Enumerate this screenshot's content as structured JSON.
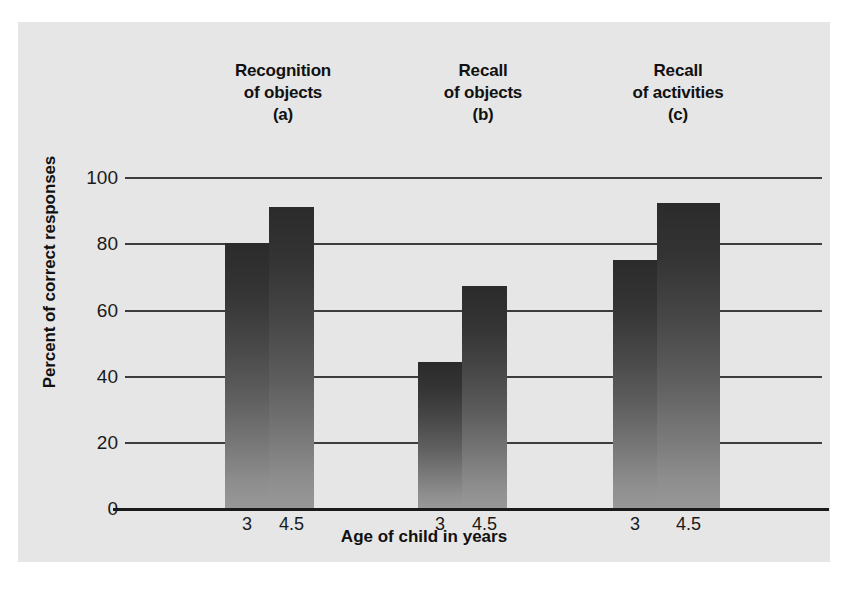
{
  "figure": {
    "background_color": "#e6e6e6",
    "bar_color_top": "#2b2b2b",
    "bar_color_bottom": "#989898"
  },
  "chart_data": {
    "type": "bar",
    "title": "",
    "xlabel": "Age of child in years",
    "ylabel": "Percent of correct responses",
    "ylim": [
      0,
      100
    ],
    "yticks": [
      0,
      20,
      40,
      60,
      80,
      100
    ],
    "ytick_labels": [
      "0",
      "20",
      "40",
      "60",
      "80",
      "100"
    ],
    "grid": true,
    "legend": "none",
    "categories": [
      "3",
      "4.5"
    ],
    "groups": [
      {
        "label_lines": [
          "Recognition",
          "of objects",
          "(a)"
        ],
        "panel": "(a)",
        "name": "Recognition of objects",
        "bars": [
          {
            "category": "3",
            "value": 80
          },
          {
            "category": "4.5",
            "value": 91
          }
        ]
      },
      {
        "label_lines": [
          "Recall",
          "of objects",
          "(b)"
        ],
        "panel": "(b)",
        "name": "Recall of objects",
        "bars": [
          {
            "category": "3",
            "value": 44
          },
          {
            "category": "4.5",
            "value": 67
          }
        ]
      },
      {
        "label_lines": [
          "Recall",
          "of activities",
          "(c)"
        ],
        "panel": "(c)",
        "name": "Recall of activities",
        "bars": [
          {
            "category": "3",
            "value": 75
          },
          {
            "category": "4.5",
            "value": 92
          }
        ]
      }
    ]
  }
}
